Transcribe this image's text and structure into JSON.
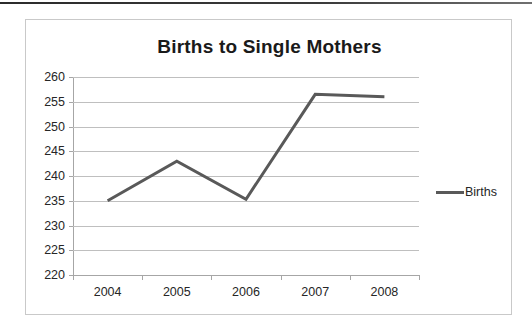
{
  "chart_data": {
    "type": "line",
    "title": "Births to Single Mothers",
    "xlabel": "",
    "ylabel": "",
    "categories": [
      "2004",
      "2005",
      "2006",
      "2007",
      "2008"
    ],
    "series": [
      {
        "name": "Births",
        "values": [
          235,
          243,
          235.3,
          256.5,
          256
        ]
      }
    ],
    "ylim": [
      220,
      260
    ],
    "yticks": [
      220,
      225,
      230,
      235,
      240,
      245,
      250,
      255,
      260
    ],
    "ytick_labels": [
      "220",
      "225",
      "230",
      "235",
      "240",
      "245",
      "250",
      "255",
      "260"
    ],
    "grid": true,
    "legend": {
      "position": "right",
      "entries": [
        "Births"
      ]
    },
    "colors": {
      "line": "#595959",
      "grid": "#bfbfbf",
      "axis": "#a6a6a6",
      "text": "#262626"
    }
  }
}
